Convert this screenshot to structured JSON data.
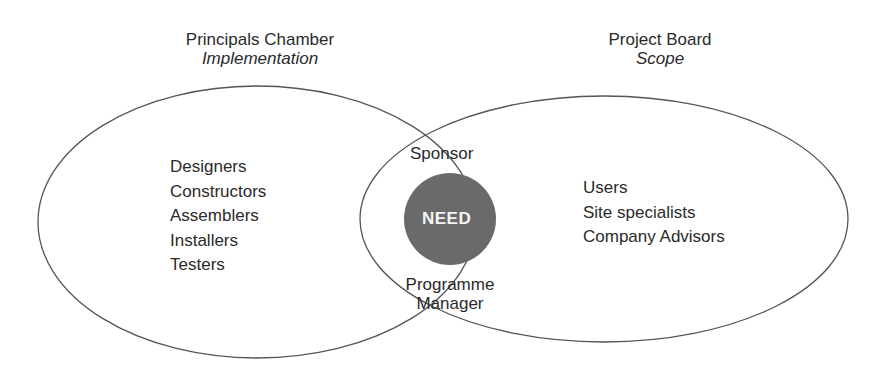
{
  "left_set": {
    "title": "Principals Chamber",
    "subtitle": "Implementation",
    "members": [
      "Designers",
      "Constructors",
      "Assemblers",
      "Installers",
      "Testers"
    ]
  },
  "right_set": {
    "title": "Project Board",
    "subtitle": "Scope",
    "members": [
      "Users",
      "Site specialists",
      "Company Advisors"
    ]
  },
  "overlap": {
    "top_label": "Sponsor",
    "bottom_label_line1": "Programme",
    "bottom_label_line2": "Manager",
    "core_label": "NEED"
  },
  "colors": {
    "stroke": "#555555",
    "core_fill": "#6a6a6a",
    "core_text": "#f4f4f4",
    "text": "#2a2a2a"
  }
}
